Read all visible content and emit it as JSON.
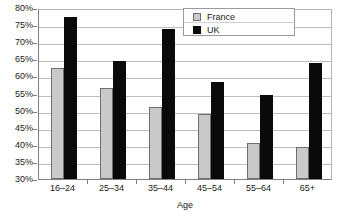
{
  "chart_data": {
    "type": "bar",
    "title": "",
    "xlabel": "Age",
    "ylabel": "",
    "categories": [
      "16–24",
      "25–34",
      "35–44",
      "45–54",
      "55–64",
      "65+"
    ],
    "series": [
      {
        "name": "France",
        "color": "#c9c9c9",
        "values": [
          62.5,
          56.5,
          51,
          49,
          40.5,
          39.5
        ]
      },
      {
        "name": "UK",
        "color": "#0a0a0a",
        "values": [
          77.5,
          64.5,
          74,
          58.5,
          54.5,
          64
        ]
      }
    ],
    "ylim": [
      30,
      80
    ],
    "ytick_labels": [
      "80%",
      "75%",
      "70%",
      "65%",
      "60%",
      "55%",
      "50%",
      "45%",
      "40%",
      "35%",
      "30%"
    ],
    "ytick_values": [
      80,
      75,
      70,
      65,
      60,
      55,
      50,
      45,
      40,
      35,
      30
    ],
    "grid": true,
    "grid_axis": "y",
    "legend_position": "top-right",
    "value_suffix": "%"
  }
}
